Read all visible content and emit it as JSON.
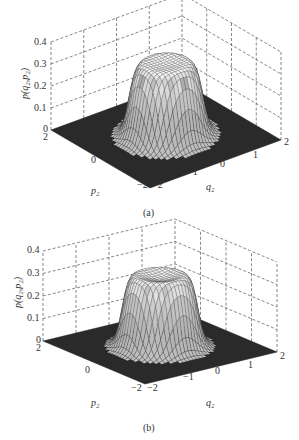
{
  "chart_data": [
    {
      "type": "surface3d",
      "panel_label": "(a)",
      "zlabel": "p(q2,p2)",
      "xlabel": "q2",
      "ylabel": "p2",
      "x_ticks": [
        "-2",
        "-1",
        "0",
        "1",
        "2"
      ],
      "y_ticks": [
        "-2",
        "0",
        "2"
      ],
      "z_ticks": [
        "0",
        "0.1",
        "0.2",
        "0.3",
        "0.4"
      ],
      "xlim": [
        -2,
        2
      ],
      "ylim": [
        -2,
        2
      ],
      "zlim": [
        0,
        0.4
      ],
      "grid": true,
      "surface": {
        "shape": "flat-top ring (top hat)",
        "peak": 0.35,
        "center_value": 0.32,
        "plateau_radius": 0.9,
        "edge_width": 0.25
      }
    },
    {
      "type": "surface3d",
      "panel_label": "(b)",
      "zlabel": "p(q2,p2)",
      "xlabel": "q2",
      "ylabel": "p2",
      "x_ticks": [
        "-2",
        "-1",
        "0",
        "1",
        "2"
      ],
      "y_ticks": [
        "-2",
        "0",
        "2"
      ],
      "z_ticks": [
        "0",
        "0.1",
        "0.2",
        "0.3",
        "0.4"
      ],
      "xlim": [
        -2,
        2
      ],
      "ylim": [
        -2,
        2
      ],
      "zlim": [
        0,
        0.4
      ],
      "grid": true,
      "surface": {
        "shape": "flat-top ring (top hat)",
        "peak": 0.36,
        "center_value": 0.3,
        "plateau_radius": 0.9,
        "edge_width": 0.25
      }
    }
  ],
  "figures": {
    "a": {
      "caption": "(a)",
      "zlabel_main": "p",
      "zlabel_args": "(q₂,p₂)",
      "xlabel": "q₂",
      "ylabel": "p₂",
      "z_ticks": [
        "0.4",
        "0.3",
        "0.2",
        "0.1",
        "0"
      ],
      "x_ticks": [
        "−2",
        "−1",
        "0",
        "1",
        "2"
      ],
      "y_ticks": [
        "2",
        "0",
        "−2"
      ]
    },
    "b": {
      "caption": "(b)",
      "zlabel_main": "p",
      "zlabel_args": "(q₂,p₂)",
      "xlabel": "q₂",
      "ylabel": "p₂",
      "z_ticks": [
        "0.4",
        "0.3",
        "0.2",
        "0.1",
        "0"
      ],
      "x_ticks": [
        "−2",
        "−1",
        "0",
        "1",
        "2"
      ],
      "y_ticks": [
        "2",
        "0",
        "−2"
      ]
    }
  },
  "colors": {
    "floor": "#2a2a2a",
    "mesh": "#1a1a1a",
    "grid": "#555555",
    "text": "#333333"
  }
}
